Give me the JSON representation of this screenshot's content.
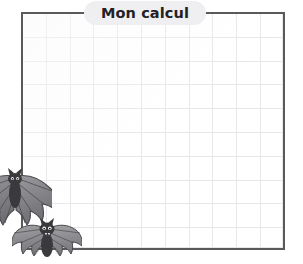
{
  "page": {
    "background_color": "#ffffff",
    "width": 303,
    "height": 264,
    "language": "fr"
  },
  "calc_box": {
    "title": "Mon calcul",
    "title_pill_color": "#efeff1",
    "title_text_color": "#222225",
    "border_color": "#5a5a5c",
    "grid_line_color": "#e6e7e9",
    "grid_cell_size_px": 24,
    "grid_columns": 11,
    "grid_rows": 10,
    "content": "",
    "placeholder": ""
  },
  "decorations": {
    "bats": [
      {
        "name": "bat-large",
        "label": "large bat",
        "body_color": "#3a3a3c",
        "wing_color": "#7e7e82",
        "cropped": true
      },
      {
        "name": "bat-small",
        "label": "small bat",
        "body_color": "#3a3a3c",
        "wing_color": "#8a8a8e",
        "cropped": false
      }
    ]
  }
}
